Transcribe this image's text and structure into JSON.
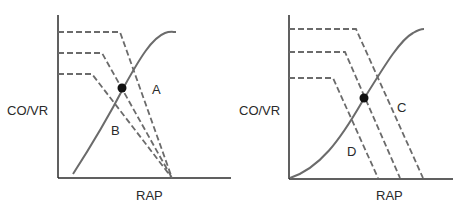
{
  "panels": [
    {
      "id": "left",
      "y_label": "CO/VR",
      "x_label": "RAP",
      "annotations": [
        {
          "text": "A",
          "x": 152,
          "y": 84
        },
        {
          "text": "B",
          "x": 111,
          "y": 125
        }
      ],
      "description": "Venous return curves with decreasing plateau converging to a common mean systemic filling pressure; cardiac function curve sigmoidal"
    },
    {
      "id": "right",
      "y_label": "CO/VR",
      "x_label": "RAP",
      "annotations": [
        {
          "text": "C",
          "x": 398,
          "y": 100
        },
        {
          "text": "D",
          "x": 347,
          "y": 147
        }
      ],
      "description": "Venous return curves shifted in parallel with differing mean systemic filling pressures; cardiac function curve sigmoidal"
    }
  ],
  "colors": {
    "axis": "#2b2b2b",
    "curve": "#6b6b6b",
    "dashed": "#6b6b6b",
    "dot": "#111111",
    "text": "#2a2a2a"
  }
}
